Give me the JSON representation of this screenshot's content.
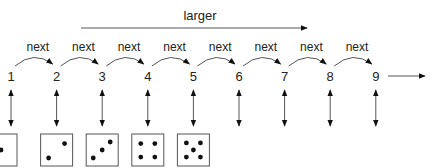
{
  "diagram": {
    "larger_label": "larger",
    "next_label": "next",
    "numbers": [
      "1",
      "2",
      "3",
      "4",
      "5",
      "6",
      "7",
      "8",
      "9"
    ],
    "dice": [
      1,
      2,
      3,
      4,
      5
    ],
    "colors": {
      "stroke": "#555555",
      "text": "#222222",
      "arrowhead": "#111111"
    }
  }
}
